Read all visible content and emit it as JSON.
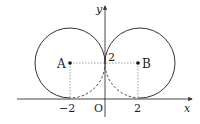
{
  "diagram": {
    "type": "coordinate-geometry",
    "axes": {
      "x_label": "x",
      "y_label": "y",
      "origin_label": "O"
    },
    "tick_labels": {
      "x_neg": "−2",
      "x_pos": "2",
      "y_pos": "2"
    },
    "points": [
      {
        "label": "A",
        "x": -2,
        "y": 2
      },
      {
        "label": "B",
        "x": 2,
        "y": 2
      }
    ],
    "circles": [
      {
        "center": "A",
        "radius": 2,
        "center_xy": [
          -2,
          2
        ]
      },
      {
        "center": "B",
        "radius": 2,
        "center_xy": [
          2,
          2
        ]
      }
    ],
    "colors": {
      "stroke": "#333333",
      "guide": "#888888"
    }
  }
}
